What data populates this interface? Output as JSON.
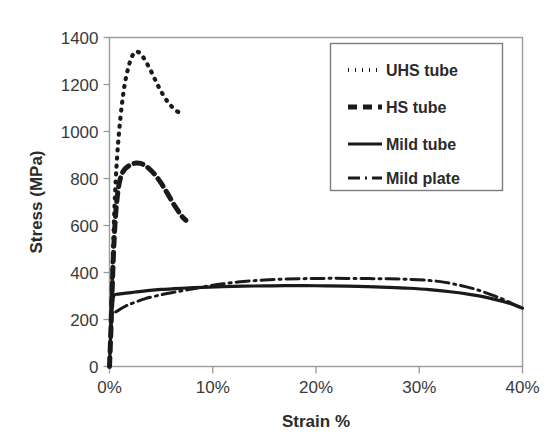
{
  "chart_data": {
    "type": "line",
    "title": "",
    "xlabel": "Strain %",
    "ylabel": "Stress (MPa)",
    "xlim": [
      0,
      40
    ],
    "ylim": [
      0,
      1400
    ],
    "xticks": [
      "0%",
      "10%",
      "20%",
      "30%",
      "40%"
    ],
    "xtick_values": [
      0,
      10,
      20,
      30,
      40
    ],
    "yticks": [
      "0",
      "200",
      "400",
      "600",
      "800",
      "1000",
      "1200",
      "1400"
    ],
    "ytick_values": [
      0,
      200,
      400,
      600,
      800,
      1000,
      1200,
      1400
    ],
    "grid": false,
    "legend_position": "upper right",
    "series": [
      {
        "name": "UHS tube",
        "style": "dotted",
        "dash": "1,7",
        "width": 4.2,
        "points": [
          [
            0.0,
            0
          ],
          [
            0.15,
            180
          ],
          [
            0.3,
            430
          ],
          [
            0.45,
            640
          ],
          [
            0.6,
            790
          ],
          [
            0.75,
            900
          ],
          [
            0.9,
            985
          ],
          [
            1.05,
            1055
          ],
          [
            1.2,
            1115
          ],
          [
            1.35,
            1165
          ],
          [
            1.5,
            1208
          ],
          [
            1.7,
            1250
          ],
          [
            1.9,
            1285
          ],
          [
            2.1,
            1312
          ],
          [
            2.35,
            1332
          ],
          [
            2.6,
            1340
          ],
          [
            2.9,
            1335
          ],
          [
            3.2,
            1320
          ],
          [
            3.5,
            1300
          ],
          [
            3.8,
            1275
          ],
          [
            4.1,
            1250
          ],
          [
            4.4,
            1222
          ],
          [
            4.7,
            1195
          ],
          [
            5.0,
            1170
          ],
          [
            5.35,
            1145
          ],
          [
            5.7,
            1122
          ],
          [
            6.05,
            1105
          ],
          [
            6.4,
            1090
          ],
          [
            6.7,
            1082
          ]
        ]
      },
      {
        "name": "HS tube",
        "style": "dashed",
        "dash": "9,6",
        "width": 5.0,
        "points": [
          [
            0.0,
            0
          ],
          [
            0.15,
            170
          ],
          [
            0.3,
            380
          ],
          [
            0.45,
            540
          ],
          [
            0.6,
            650
          ],
          [
            0.75,
            720
          ],
          [
            0.9,
            770
          ],
          [
            1.05,
            800
          ],
          [
            1.2,
            820
          ],
          [
            1.4,
            835
          ],
          [
            1.6,
            845
          ],
          [
            1.9,
            855
          ],
          [
            2.2,
            862
          ],
          [
            2.6,
            866
          ],
          [
            3.0,
            864
          ],
          [
            3.4,
            856
          ],
          [
            3.8,
            843
          ],
          [
            4.2,
            826
          ],
          [
            4.6,
            805
          ],
          [
            5.0,
            780
          ],
          [
            5.4,
            752
          ],
          [
            5.8,
            722
          ],
          [
            6.2,
            692
          ],
          [
            6.6,
            665
          ],
          [
            7.0,
            640
          ],
          [
            7.4,
            622
          ]
        ]
      },
      {
        "name": "Mild tube",
        "style": "solid",
        "dash": "",
        "width": 3.2,
        "points": [
          [
            0.0,
            0
          ],
          [
            0.1,
            120
          ],
          [
            0.2,
            230
          ],
          [
            0.35,
            290
          ],
          [
            0.5,
            305
          ],
          [
            0.8,
            308
          ],
          [
            1.2,
            310
          ],
          [
            1.8,
            313
          ],
          [
            2.5,
            317
          ],
          [
            3.5,
            322
          ],
          [
            5.0,
            328
          ],
          [
            7.0,
            333
          ],
          [
            9.0,
            337
          ],
          [
            11.0,
            340
          ],
          [
            13.0,
            342
          ],
          [
            15.0,
            343
          ],
          [
            17.0,
            344
          ],
          [
            19.0,
            344
          ],
          [
            21.0,
            343
          ],
          [
            23.0,
            342
          ],
          [
            25.0,
            340
          ],
          [
            27.0,
            337
          ],
          [
            29.0,
            333
          ],
          [
            31.0,
            327
          ],
          [
            33.0,
            318
          ],
          [
            35.0,
            306
          ],
          [
            36.5,
            294
          ],
          [
            38.0,
            278
          ],
          [
            39.0,
            265
          ],
          [
            40.0,
            248
          ]
        ]
      },
      {
        "name": "Mild plate",
        "style": "dashdot",
        "dash": "13,5,2,5",
        "width": 3.0,
        "points": [
          [
            0.6,
            232
          ],
          [
            1.0,
            243
          ],
          [
            1.6,
            258
          ],
          [
            2.4,
            272
          ],
          [
            3.4,
            288
          ],
          [
            5.0,
            305
          ],
          [
            6.5,
            318
          ],
          [
            8.0,
            330
          ],
          [
            9.5,
            342
          ],
          [
            11.0,
            352
          ],
          [
            13.0,
            362
          ],
          [
            15.0,
            368
          ],
          [
            17.0,
            372
          ],
          [
            19.0,
            374
          ],
          [
            21.0,
            375
          ],
          [
            23.0,
            375
          ],
          [
            25.0,
            374
          ],
          [
            27.0,
            373
          ],
          [
            29.0,
            371
          ],
          [
            31.0,
            366
          ],
          [
            32.5,
            358
          ],
          [
            34.0,
            345
          ],
          [
            35.5,
            328
          ],
          [
            37.0,
            305
          ],
          [
            38.0,
            288
          ],
          [
            39.0,
            268
          ],
          [
            40.0,
            248
          ]
        ]
      }
    ],
    "legend": [
      {
        "label": "UHS tube",
        "style": "dotted"
      },
      {
        "label": "HS tube",
        "style": "dashed"
      },
      {
        "label": "Mild tube",
        "style": "solid"
      },
      {
        "label": "Mild plate",
        "style": "dashdot"
      }
    ],
    "colors": {
      "series": "#1a1a1a",
      "axis": "#9a9a9a",
      "text": "#2b2b2b",
      "background": "#ffffff"
    }
  }
}
